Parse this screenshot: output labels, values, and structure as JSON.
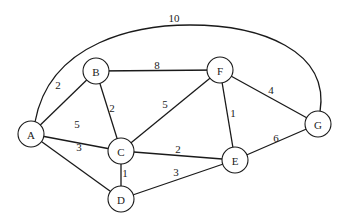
{
  "graph": {
    "node_radius": 13,
    "nodes": [
      {
        "id": "A",
        "label": "A",
        "x": 31,
        "y": 134
      },
      {
        "id": "B",
        "label": "B",
        "x": 96,
        "y": 71
      },
      {
        "id": "C",
        "label": "C",
        "x": 121,
        "y": 151
      },
      {
        "id": "D",
        "label": "D",
        "x": 121,
        "y": 199
      },
      {
        "id": "E",
        "label": "E",
        "x": 235,
        "y": 160
      },
      {
        "id": "F",
        "label": "F",
        "x": 220,
        "y": 70
      },
      {
        "id": "G",
        "label": "G",
        "x": 318,
        "y": 124
      }
    ],
    "edges": [
      {
        "from": "A",
        "to": "B",
        "weight": "2",
        "lx": 58,
        "ly": 85
      },
      {
        "from": "A",
        "to": "C",
        "weight": "5",
        "lx": 77,
        "ly": 124
      },
      {
        "from": "A",
        "to": "D",
        "weight": "3",
        "lx": 79,
        "ly": 147
      },
      {
        "from": "B",
        "to": "C",
        "weight": "2",
        "lx": 112,
        "ly": 108
      },
      {
        "from": "B",
        "to": "F",
        "weight": "8",
        "lx": 157,
        "ly": 65
      },
      {
        "from": "C",
        "to": "F",
        "weight": "5",
        "lx": 165,
        "ly": 104
      },
      {
        "from": "C",
        "to": "D",
        "weight": "1",
        "lx": 125,
        "ly": 173
      },
      {
        "from": "C",
        "to": "E",
        "weight": "2",
        "lx": 178,
        "ly": 149
      },
      {
        "from": "D",
        "to": "E",
        "weight": "3",
        "lx": 176,
        "ly": 172
      },
      {
        "from": "F",
        "to": "E",
        "weight": "1",
        "lx": 233,
        "ly": 113
      },
      {
        "from": "F",
        "to": "G",
        "weight": "4",
        "lx": 271,
        "ly": 90
      },
      {
        "from": "E",
        "to": "G",
        "weight": "6",
        "lx": 276,
        "ly": 138
      },
      {
        "from": "A",
        "to": "G",
        "weight": "10",
        "curved": true,
        "lx": 174,
        "ly": 18
      }
    ]
  }
}
